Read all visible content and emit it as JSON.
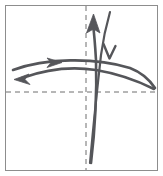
{
  "figure": {
    "width": 163,
    "height": 176,
    "background_color": "#ffffff",
    "border_color": "#8d8d8d"
  },
  "axes": {
    "stroke_color": "#6e6e6e",
    "style": "dashed",
    "origin": {
      "x": 86,
      "y": 92
    },
    "horizontal": {
      "label": "horizontal-axis",
      "x1": 6,
      "y1": 92,
      "x2": 157,
      "y2": 92
    },
    "vertical": {
      "label": "vertical-axis",
      "x1": 86,
      "y1": 6,
      "x2": 86,
      "y2": 170
    }
  },
  "trajectories": {
    "stroke_color": "#55565a",
    "items": [
      {
        "id": "upper-horizontal-arc",
        "label": "Upper rightward arc",
        "direction": "rightward",
        "arrowhead": "solid-triangle",
        "arrow_position": {
          "x": 57,
          "y": 62
        },
        "path": "M 13,70 C 45,58 95,57 130,68 C 143,73 151,82 155,88"
      },
      {
        "id": "lower-horizontal-arc",
        "label": "Lower leftward arc",
        "direction": "leftward",
        "arrowhead": "solid-triangle",
        "arrow_position": {
          "x": 20,
          "y": 79
        },
        "path": "M 154,89 C 140,82 120,74 96,70 C 70,66 44,70 22,78"
      },
      {
        "id": "left-vertical-curve",
        "label": "Upward curve",
        "direction": "upward",
        "arrowhead": "solid-triangle",
        "arrow_position": {
          "x": 95,
          "y": 19
        },
        "path": "M 91,163 C 95,130 97,95 96,60 C 95,43 94,32 93,25"
      },
      {
        "id": "right-vertical-curve",
        "label": "Downward curve",
        "direction": "downward",
        "arrowhead": "open-chevron",
        "arrow_position": {
          "x": 110,
          "y": 56
        },
        "path": "M 110,12 C 106,26 103,40 101,55 C 97,90 93,130 90,163"
      }
    ]
  }
}
